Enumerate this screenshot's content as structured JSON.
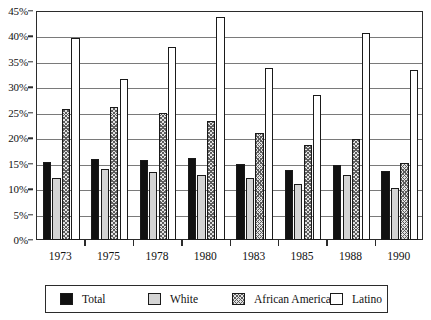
{
  "chart_data": {
    "type": "bar",
    "title": "",
    "subtitle": "",
    "xlabel": "",
    "ylabel": "",
    "categories": [
      "1973",
      "1975",
      "1978",
      "1980",
      "1983",
      "1985",
      "1988",
      "1990"
    ],
    "ylim": [
      0,
      45
    ],
    "ytick_values": [
      0,
      5,
      10,
      15,
      20,
      25,
      30,
      35,
      40,
      45
    ],
    "ytick_labels": [
      "0%",
      "5%",
      "10%",
      "15%",
      "20%",
      "25%",
      "30%",
      "35%",
      "40%",
      "45%"
    ],
    "grid": true,
    "grid_axis": "y",
    "legend_position": "bottom",
    "value_suffix": "%",
    "series": [
      {
        "name": "Total",
        "fill": "solid-black",
        "color": "#111111",
        "values": [
          15.3,
          16.0,
          15.8,
          16.2,
          15.0,
          13.8,
          14.7,
          13.5
        ]
      },
      {
        "name": "White",
        "fill": "light-gray",
        "color": "#d4d4d4",
        "values": [
          12.2,
          13.9,
          13.3,
          12.7,
          12.2,
          11.0,
          12.7,
          10.2
        ]
      },
      {
        "name": "African American",
        "fill": "cross-hatch",
        "color": "#e2e2e2",
        "values": [
          25.8,
          26.2,
          24.9,
          23.3,
          21.0,
          18.6,
          19.9,
          15.1
        ]
      },
      {
        "name": "Latino",
        "fill": "white-outline",
        "color": "#ffffff",
        "values": [
          39.6,
          31.6,
          38.0,
          43.8,
          33.8,
          28.4,
          40.7,
          33.4
        ]
      }
    ]
  }
}
